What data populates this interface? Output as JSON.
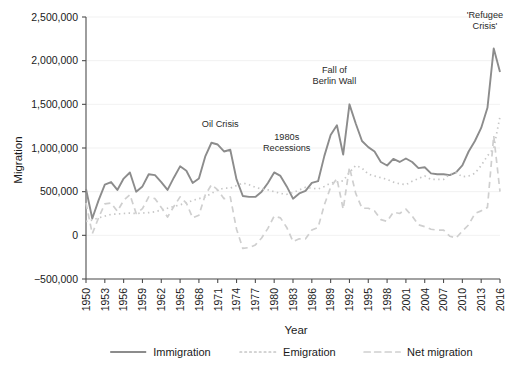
{
  "chart_data": {
    "type": "line",
    "title": "",
    "xlabel": "Year",
    "ylabel": "Migration",
    "xlim": [
      1950,
      2016
    ],
    "ylim": [
      -500000,
      2500000
    ],
    "grid": true,
    "legend_position": "bottom",
    "y_ticks": [
      {
        "value": 2500000,
        "label": "2,500,000"
      },
      {
        "value": 2000000,
        "label": "2,000,000"
      },
      {
        "value": 1500000,
        "label": "1,500,000"
      },
      {
        "value": 1000000,
        "label": "1,000,000"
      },
      {
        "value": 500000,
        "label": "500,000"
      },
      {
        "value": 0,
        "label": "0"
      },
      {
        "value": -500000,
        "label": "−500,000"
      }
    ],
    "x_ticks": [
      {
        "value": 1950,
        "label": "1950"
      },
      {
        "value": 1953,
        "label": "1953"
      },
      {
        "value": 1956,
        "label": "1956"
      },
      {
        "value": 1959,
        "label": "1959"
      },
      {
        "value": 1962,
        "label": "1962"
      },
      {
        "value": 1965,
        "label": "1965"
      },
      {
        "value": 1968,
        "label": "1968"
      },
      {
        "value": 1971,
        "label": "1971"
      },
      {
        "value": 1974,
        "label": "1974"
      },
      {
        "value": 1977,
        "label": "1977"
      },
      {
        "value": 1980,
        "label": "1980"
      },
      {
        "value": 1983,
        "label": "1983"
      },
      {
        "value": 1986,
        "label": "1986"
      },
      {
        "value": 1989,
        "label": "1989"
      },
      {
        "value": 1992,
        "label": "1992"
      },
      {
        "value": 1995,
        "label": "1995"
      },
      {
        "value": 1998,
        "label": "1998"
      },
      {
        "value": 2001,
        "label": "2001"
      },
      {
        "value": 2004,
        "label": "2004"
      },
      {
        "value": 2007,
        "label": "2007"
      },
      {
        "value": 2010,
        "label": "2010"
      },
      {
        "value": 2013,
        "label": "2013"
      },
      {
        "value": 2016,
        "label": "2016"
      }
    ],
    "x": [
      1950,
      1951,
      1952,
      1953,
      1954,
      1955,
      1956,
      1957,
      1958,
      1959,
      1960,
      1961,
      1962,
      1963,
      1964,
      1965,
      1966,
      1967,
      1968,
      1969,
      1970,
      1971,
      1972,
      1973,
      1974,
      1975,
      1976,
      1977,
      1978,
      1979,
      1980,
      1981,
      1982,
      1983,
      1984,
      1985,
      1986,
      1987,
      1988,
      1989,
      1990,
      1991,
      1992,
      1993,
      1994,
      1995,
      1996,
      1997,
      1998,
      1999,
      2000,
      2001,
      2002,
      2003,
      2004,
      2005,
      2006,
      2007,
      2008,
      2009,
      2010,
      2011,
      2012,
      2013,
      2014,
      2015,
      2016
    ],
    "series": [
      {
        "name": "Immigration",
        "style": "solid",
        "color": "#8c8c8c",
        "values": [
          530000,
          193000,
          400000,
          580000,
          610000,
          520000,
          650000,
          720000,
          500000,
          560000,
          700000,
          690000,
          610000,
          520000,
          660000,
          790000,
          740000,
          600000,
          650000,
          900000,
          1060000,
          1040000,
          960000,
          980000,
          640000,
          450000,
          440000,
          440000,
          500000,
          600000,
          720000,
          680000,
          560000,
          420000,
          480000,
          510000,
          600000,
          620000,
          910000,
          1150000,
          1260000,
          925000,
          1500000,
          1280000,
          1080000,
          1010000,
          960000,
          840000,
          800000,
          875000,
          840000,
          880000,
          840000,
          770000,
          780000,
          710000,
          700000,
          700000,
          690000,
          720000,
          800000,
          960000,
          1080000,
          1230000,
          1460000,
          2140000,
          1870000
        ]
      },
      {
        "name": "Emigration",
        "style": "dotted",
        "color": "#c6c6c6",
        "values": [
          160000,
          175000,
          200000,
          220000,
          240000,
          245000,
          250000,
          255000,
          250000,
          255000,
          260000,
          270000,
          290000,
          310000,
          330000,
          350000,
          370000,
          400000,
          420000,
          440000,
          480000,
          520000,
          540000,
          540000,
          570000,
          600000,
          580000,
          550000,
          530000,
          520000,
          500000,
          480000,
          470000,
          490000,
          520000,
          550000,
          540000,
          530000,
          560000,
          600000,
          610000,
          625000,
          720000,
          800000,
          770000,
          700000,
          680000,
          660000,
          640000,
          610000,
          590000,
          580000,
          620000,
          650000,
          680000,
          640000,
          640000,
          640000,
          700000,
          720000,
          670000,
          680000,
          710000,
          800000,
          910000,
          1000000,
          1360000
        ]
      },
      {
        "name": "Net migration",
        "style": "dashed",
        "color": "#cfcfcf",
        "values": [
          370000,
          18000,
          200000,
          360000,
          370000,
          275000,
          400000,
          465000,
          250000,
          305000,
          440000,
          420000,
          320000,
          210000,
          330000,
          440000,
          370000,
          200000,
          230000,
          460000,
          580000,
          520000,
          420000,
          440000,
          70000,
          -150000,
          -140000,
          -110000,
          -30000,
          80000,
          220000,
          200000,
          90000,
          -70000,
          -40000,
          -40000,
          60000,
          90000,
          350000,
          550000,
          650000,
          300000,
          780000,
          480000,
          310000,
          310000,
          280000,
          180000,
          160000,
          265000,
          250000,
          300000,
          220000,
          120000,
          100000,
          70000,
          60000,
          60000,
          -10000,
          -30000,
          50000,
          120000,
          250000,
          280000,
          320000,
          1140000,
          500000
        ]
      }
    ],
    "annotations": [
      {
        "text_lines": [
          "Oil Crisis"
        ],
        "x": 1971.4,
        "y": 1240000,
        "anchor": "middle"
      },
      {
        "text_lines": [
          "1980s",
          "Recessions"
        ],
        "x": 1982.0,
        "y": 1090000,
        "anchor": "middle"
      },
      {
        "text_lines": [
          "Fall of",
          "Berlin Wall"
        ],
        "x": 1989.6,
        "y": 1860000,
        "anchor": "middle"
      },
      {
        "text_lines": [
          "'Refugee",
          "Crisis'"
        ],
        "x": 2013.6,
        "y": 2490000,
        "anchor": "middle"
      }
    ]
  },
  "legend": {
    "items": [
      {
        "label": "Immigration",
        "style": "solid",
        "color": "#8c8c8c"
      },
      {
        "label": "Emigration",
        "style": "dotted",
        "color": "#c6c6c6"
      },
      {
        "label": "Net migration",
        "style": "dashed",
        "color": "#cfcfcf"
      }
    ]
  },
  "colors": {
    "axis": "#4d4d4d",
    "grid": "#ededed",
    "text": "#1a1a1a",
    "background": "#ffffff"
  }
}
